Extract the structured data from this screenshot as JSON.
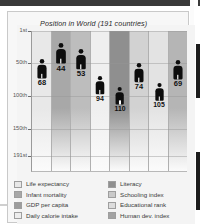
{
  "chart_title": "Position in World (191 countries)",
  "chart_data": {
    "type": "bar",
    "title": "Position in World (191 countries)",
    "xlabel": "",
    "ylabel": "",
    "ylim": [
      1,
      191
    ],
    "inverted_y": true,
    "grid": true,
    "legend_position": "bottom",
    "categories": [
      "Life expectancy",
      "Infant mortality",
      "GDP per capita",
      "Daily calorie intake",
      "Literacy",
      "Schooling index",
      "Educational rank",
      "Human dev. index"
    ],
    "values": [
      68,
      44,
      53,
      94,
      110,
      74,
      105,
      69
    ],
    "tick_labels": [
      "1st",
      "50th",
      "100th",
      "150th",
      "191st"
    ],
    "tick_values": [
      1,
      50,
      100,
      150,
      191
    ],
    "band_colors": [
      "#e8e8e8",
      "#a8a8a8",
      "#bdbdbd",
      "#efefef",
      "#8f8f8f",
      "#d2d2d2",
      "#e3e3e3",
      "#b5b5b5"
    ]
  },
  "axis": {
    "ticks": [
      {
        "label": "1st",
        "value": 1
      },
      {
        "label": "50th",
        "value": 50
      },
      {
        "label": "100th",
        "value": 100
      },
      {
        "label": "150th",
        "value": 150
      },
      {
        "label": "191st",
        "value": 191
      }
    ]
  },
  "markers": [
    {
      "label": "68",
      "name": "life-expectancy"
    },
    {
      "label": "44",
      "name": "infant-mortality"
    },
    {
      "label": "53",
      "name": "gdp-per-capita"
    },
    {
      "label": "94",
      "name": "daily-calorie-intake"
    },
    {
      "label": "110",
      "name": "literacy"
    },
    {
      "label": "74",
      "name": "schooling-index"
    },
    {
      "label": "105",
      "name": "educational-rank"
    },
    {
      "label": "69",
      "name": "human-dev-index"
    }
  ],
  "legend": {
    "left": [
      {
        "label": "Life expectancy",
        "color": "#e8e8e8"
      },
      {
        "label": "Infant mortality",
        "color": "#a8a8a8"
      },
      {
        "label": "GDP per capita",
        "color": "#9d9d9d"
      },
      {
        "label": "Daily calorie intake",
        "color": "#ededed"
      }
    ],
    "right": [
      {
        "label": "Literacy",
        "color": "#8f8f8f"
      },
      {
        "label": "Schooling index",
        "color": "#c9c9c9"
      },
      {
        "label": "Educational rank",
        "color": "#dcdcdc"
      },
      {
        "label": "Human dev. index",
        "color": "#a3a3a3"
      }
    ]
  }
}
